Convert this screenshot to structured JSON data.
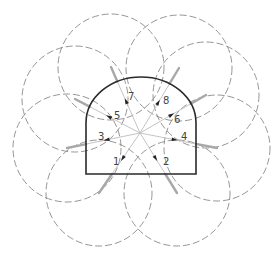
{
  "diagram": {
    "colors": {
      "outline": "#2a2a2a",
      "ray": "#bdbdbd",
      "bolt": "#a8a8a8",
      "circle": "#8a8a8a",
      "arrow": "#222222",
      "label": "#444444"
    },
    "center": [
      140,
      133
    ],
    "tunnel": {
      "left": 86,
      "right": 196,
      "bottom": 174,
      "spring": 123,
      "crown": 77
    },
    "bolts": [
      {
        "id": "1",
        "label": "1",
        "end": [
          99,
          193
        ],
        "label_pos": [
          113,
          165
        ],
        "circle_r": 53
      },
      {
        "id": "2",
        "label": "2",
        "end": [
          177,
          193
        ],
        "label_pos": [
          163,
          165
        ],
        "circle_r": 53
      },
      {
        "id": "3",
        "label": "3",
        "end": [
          67,
          148
        ],
        "label_pos": [
          98,
          140
        ],
        "circle_r": 54
      },
      {
        "id": "4",
        "label": "4",
        "end": [
          217,
          148
        ],
        "label_pos": [
          181,
          140
        ],
        "circle_r": 53
      },
      {
        "id": "5",
        "label": "5",
        "end": [
          75,
          99
        ],
        "label_pos": [
          114,
          119
        ],
        "circle_r": 53
      },
      {
        "id": "6",
        "label": "6",
        "end": [
          206,
          95
        ],
        "label_pos": [
          174,
          123
        ],
        "circle_r": 53
      },
      {
        "id": "7",
        "label": "7",
        "end": [
          111,
          67
        ],
        "label_pos": [
          128,
          100
        ],
        "circle_r": 53
      },
      {
        "id": "8",
        "label": "8",
        "end": [
          179,
          68
        ],
        "label_pos": [
          163,
          104
        ],
        "circle_r": 53
      }
    ]
  }
}
